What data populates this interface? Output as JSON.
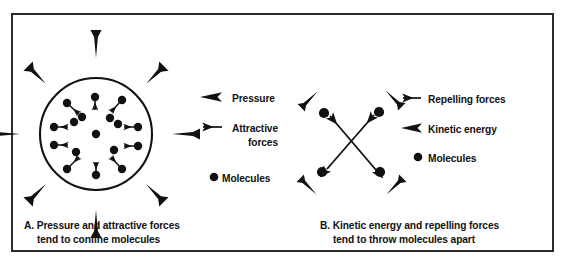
{
  "figure": {
    "border_color": "#2b2b2b",
    "ink_color": "#111111",
    "background": "#ffffff"
  },
  "panel_a": {
    "id": "A",
    "caption_line1": "A.  Pressure and attractive forces",
    "caption_line2": "tend to confine molecules",
    "diagram": {
      "shape": "circle",
      "center": [
        96,
        134
      ],
      "radius": 56,
      "molecule_count": 17,
      "inward_arrow_count": 8,
      "description": "circle of molecules with attractive force arrows pointing inward and pressure arrows pointing inward from outside"
    },
    "legend": [
      {
        "icon": "thick-arrowhead-left-icon",
        "label": "Pressure"
      },
      {
        "icon": "thin-arrow-left-icon",
        "label": "Attractive"
      },
      {
        "icon": "none",
        "label": "forces"
      },
      {
        "icon": "dot-icon",
        "label": "Molecules"
      }
    ]
  },
  "panel_b": {
    "id": "B",
    "caption_line1": "B.  Kinetic energy and repelling forces",
    "caption_line2": "tend to throw molecules apart",
    "diagram": {
      "shape": "x-cross",
      "center": [
        351,
        140
      ],
      "molecule_count": 4,
      "outward_arrow_count": 4,
      "description": "four molecules at corners of an X with double headed repelling force arrows crossing the centre and kinetic energy arrowheads pointing outward"
    },
    "legend": [
      {
        "icon": "thin-arrow-left-icon",
        "label": "Repelling forces"
      },
      {
        "icon": "thick-arrowhead-left-icon",
        "label": "Kinetic energy"
      },
      {
        "icon": "dot-icon",
        "label": "Molecules"
      }
    ]
  }
}
